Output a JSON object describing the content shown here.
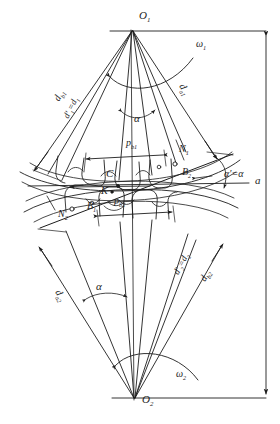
{
  "figure": {
    "type": "engineering-diagram",
    "background_color": "#ffffff",
    "line_color": "#1d1d1d"
  },
  "centers": {
    "top": {
      "label": "O",
      "sub": "1",
      "x": 134,
      "y": 18
    },
    "bottom": {
      "label": "O",
      "sub": "2",
      "x": 137,
      "y": 402
    }
  },
  "rotation": {
    "top": {
      "label": "ω",
      "sub": "1",
      "x": 196,
      "y": 44
    },
    "bottom": {
      "label": "ω",
      "sub": "2",
      "x": 176,
      "y": 374
    }
  },
  "diameters": {
    "da1": {
      "text": "d",
      "sub": "a1",
      "x": 190,
      "y": 88,
      "rot": 64
    },
    "db1": {
      "text": "d",
      "sub": "b1",
      "x": 55,
      "y": 103,
      "rot": -66
    },
    "dp1": {
      "text": "d'",
      "sub": "1",
      "tail": "=d",
      "tail_sub": "1",
      "x": 66,
      "y": 120,
      "rot": -69
    },
    "da2": {
      "text": "d",
      "sub": "a2",
      "x": 66,
      "y": 294,
      "rot": 62
    },
    "db2": {
      "text": "d",
      "sub": "b2",
      "x": 200,
      "y": 283,
      "rot": -63
    },
    "dp2": {
      "text": "d'",
      "sub": "2",
      "tail": "=d",
      "tail_sub": "2",
      "x": 178,
      "y": 277,
      "rot": -66
    }
  },
  "angles": {
    "alpha_top": {
      "text": "α",
      "x": 136,
      "y": 118
    },
    "alpha_bottom": {
      "text": "α",
      "x": 98,
      "y": 287
    },
    "alpha_prime": {
      "text": "α'=α",
      "x": 226,
      "y": 175
    }
  },
  "points": {
    "N1": {
      "text": "N",
      "sub": "1",
      "x": 181,
      "y": 150
    },
    "N2": {
      "text": "N",
      "sub": "2",
      "x": 61,
      "y": 215
    },
    "B1": {
      "text": "B",
      "sub": "1",
      "x": 89,
      "y": 207
    },
    "B2": {
      "text": "B",
      "sub": "2",
      "x": 184,
      "y": 173
    },
    "C": {
      "text": "C",
      "sub": "",
      "x": 109,
      "y": 174
    },
    "K": {
      "text": "K",
      "sub": "",
      "x": 103,
      "y": 191
    }
  },
  "pitches": {
    "pb1": {
      "text": "p",
      "sub": "b1",
      "x": 130,
      "y": 144
    },
    "pb2": {
      "text": "p",
      "sub": "b2",
      "x": 118,
      "y": 201
    }
  },
  "center_distance": {
    "text": "a",
    "x": 257,
    "y": 180
  },
  "right_dimension": {
    "name": "center-distance-arrow",
    "x": 266,
    "top_y": 30,
    "bottom_y": 400
  }
}
